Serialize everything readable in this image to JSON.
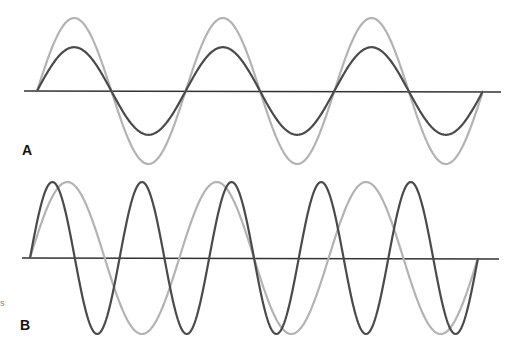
{
  "panels": [
    {
      "label": "A",
      "description": "Two in-phase sine waves of equal frequency, different amplitude",
      "waves": [
        {
          "name": "large-amplitude-wave",
          "color": "#b3b3b3",
          "amplitude": 1.0,
          "cycles": 3,
          "phase": 0
        },
        {
          "name": "small-amplitude-wave",
          "color": "#4a4a4a",
          "amplitude": 0.6,
          "cycles": 3,
          "phase": 0
        }
      ]
    },
    {
      "label": "B",
      "description": "Two sine waves of equal amplitude, different frequency",
      "waves": [
        {
          "name": "low-frequency-wave",
          "color": "#b3b3b3",
          "amplitude": 1.0,
          "cycles": 3,
          "phase": 0
        },
        {
          "name": "high-frequency-wave",
          "color": "#4a4a4a",
          "amplitude": 1.0,
          "cycles": 5,
          "phase": 0
        }
      ]
    }
  ],
  "axis_color": "#333333",
  "edge_fragment": "s"
}
